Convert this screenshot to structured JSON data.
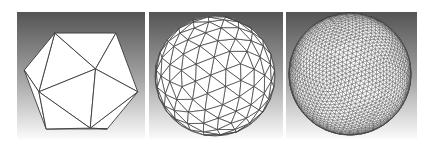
{
  "figure": {
    "background": {
      "top": "#545454",
      "bottom": "#fbfbfb"
    },
    "mesh": {
      "fill": "#ffffff",
      "edge": "#3a3a3a"
    },
    "panels": [
      {
        "id": "low",
        "label": "",
        "subdivision_level": 0,
        "x": 17,
        "width": 128,
        "cx": 64,
        "cy": 69,
        "r": 60
      },
      {
        "id": "medium",
        "label": "",
        "subdivision_level": 2,
        "x": 149,
        "width": 134,
        "cx": 66,
        "cy": 64,
        "r": 60
      },
      {
        "id": "high",
        "label": "",
        "subdivision_level": 4,
        "x": 286,
        "width": 131,
        "cx": 64,
        "cy": 62,
        "r": 61
      }
    ]
  }
}
